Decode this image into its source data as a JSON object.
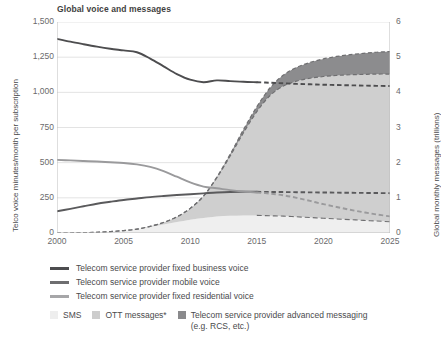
{
  "chart_data": {
    "type": "area",
    "title": "Global voice and messages",
    "xlabel": "",
    "ylabel": "Telco voice minutes/month per subscription",
    "y2label": "Global monthly messages (trillions)",
    "grid": true,
    "legend_position": "bottom",
    "xlim": [
      2000,
      2025
    ],
    "ylim": [
      0,
      1500
    ],
    "y2lim": [
      0,
      6
    ],
    "x_ticks": [
      "2000",
      "2005",
      "2010",
      "2015",
      "2020",
      "2025"
    ],
    "x_tick_values": [
      2000,
      2005,
      2010,
      2015,
      2020,
      2025
    ],
    "y_ticks": [
      "0",
      "250",
      "500",
      "750",
      "1,000",
      "1,250",
      "1,500"
    ],
    "y_tick_values": [
      0,
      250,
      500,
      750,
      1000,
      1250,
      1500
    ],
    "y2_ticks": [
      "0",
      "1",
      "2",
      "3",
      "4",
      "5",
      "6"
    ],
    "y2_tick_values": [
      0,
      1,
      2,
      3,
      4,
      5,
      6
    ],
    "forecast_start": 2015,
    "x": [
      2000,
      2001,
      2002,
      2003,
      2004,
      2005,
      2006,
      2007,
      2008,
      2009,
      2010,
      2011,
      2012,
      2013,
      2014,
      2015,
      2016,
      2017,
      2018,
      2019,
      2020,
      2021,
      2022,
      2023,
      2024,
      2025
    ],
    "series": [
      {
        "name": "Telecom service provider fixed business voice",
        "type": "line",
        "axis": "left",
        "color": "#4d4d4f",
        "values": [
          1380,
          1360,
          1342,
          1325,
          1310,
          1298,
          1285,
          1240,
          1185,
          1130,
          1090,
          1072,
          1085,
          1080,
          1075,
          1072,
          1068,
          1064,
          1060,
          1057,
          1054,
          1052,
          1050,
          1048,
          1046,
          1045
        ]
      },
      {
        "name": "Telecom service provider mobile voice",
        "type": "line",
        "axis": "left",
        "color": "#5a5a5c",
        "values": [
          155,
          172,
          190,
          208,
          222,
          235,
          245,
          255,
          263,
          270,
          276,
          282,
          288,
          292,
          293,
          293,
          292,
          291,
          290,
          289,
          288,
          287,
          286,
          285,
          284,
          283
        ]
      },
      {
        "name": "Telecom service provider fixed residential voice",
        "type": "line",
        "axis": "left",
        "color": "#9a9a9c",
        "values": [
          520,
          516,
          512,
          508,
          503,
          498,
          488,
          470,
          440,
          400,
          360,
          330,
          318,
          305,
          295,
          288,
          280,
          268,
          250,
          228,
          205,
          185,
          165,
          148,
          132,
          118
        ]
      },
      {
        "name": "SMS",
        "type": "area",
        "axis": "right",
        "color": "#efefef",
        "values": [
          0.0,
          0.0,
          0.01,
          0.02,
          0.04,
          0.07,
          0.11,
          0.17,
          0.24,
          0.31,
          0.38,
          0.43,
          0.47,
          0.49,
          0.5,
          0.5,
          0.49,
          0.48,
          0.46,
          0.44,
          0.42,
          0.4,
          0.38,
          0.36,
          0.34,
          0.32
        ]
      },
      {
        "name": "OTT messages*",
        "type": "area",
        "axis": "right",
        "color": "#cfcfcf",
        "values": [
          0.0,
          0.0,
          0.0,
          0.0,
          0.0,
          0.0,
          0.0,
          0.02,
          0.06,
          0.15,
          0.32,
          0.62,
          1.1,
          1.7,
          2.35,
          2.95,
          3.42,
          3.7,
          3.86,
          3.96,
          4.03,
          4.08,
          4.12,
          4.15,
          4.18,
          4.2
        ]
      },
      {
        "name": "Telecom service provider advanced messaging (e.g. RCS, etc.)",
        "type": "area",
        "axis": "right",
        "color": "#8c8c8e",
        "values": [
          0.0,
          0.0,
          0.0,
          0.0,
          0.0,
          0.0,
          0.0,
          0.0,
          0.0,
          0.0,
          0.0,
          0.0,
          0.02,
          0.05,
          0.09,
          0.14,
          0.22,
          0.31,
          0.39,
          0.45,
          0.5,
          0.54,
          0.57,
          0.6,
          0.62,
          0.64
        ]
      }
    ]
  },
  "title": {
    "text": "Global voice and messages"
  },
  "axes": {
    "left_label": "Telco voice minutes/month per subscription",
    "right_label": "Global monthly messages (trillions)",
    "left_ticks": [
      "1,500",
      "1,250",
      "1,000",
      "750",
      "500",
      "250",
      "0"
    ],
    "right_ticks": [
      "6",
      "5",
      "4",
      "3",
      "2",
      "1",
      "0"
    ],
    "x_ticks": [
      "2000",
      "2005",
      "2010",
      "2015",
      "2020",
      "2025"
    ]
  },
  "legend": {
    "lines": [
      {
        "label": "Telecom service provider fixed business voice",
        "color": "#4d4d4f"
      },
      {
        "label": "Telecom service provider mobile voice",
        "color": "#6e6e70"
      },
      {
        "label": "Telecom service provider fixed residential voice",
        "color": "#a6a6a8"
      }
    ],
    "areas": [
      {
        "label": "SMS",
        "sub": "",
        "color": "#eeeeee"
      },
      {
        "label": "OTT messages*",
        "sub": "",
        "color": "#cdcdcd"
      },
      {
        "label": "Telecom service provider advanced messaging",
        "sub": "(e.g. RCS, etc.)",
        "color": "#8a8a8c"
      }
    ]
  },
  "colors": {
    "grid": "#e3e3e3",
    "axis": "#bdbdbd",
    "text": "#58585a",
    "title": "#3f3f41"
  }
}
